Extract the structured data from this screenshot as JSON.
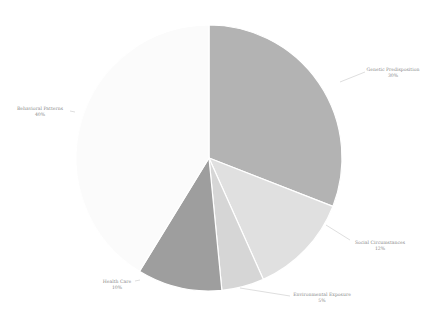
{
  "chart_data": {
    "type": "pie",
    "title": "",
    "start": "top",
    "direction": "clockwise",
    "slices": [
      {
        "label": "Genetic Predisposition",
        "value": 30,
        "display": "30%",
        "color": "#b3b3b3"
      },
      {
        "label": "Social Circumstances",
        "value": 12,
        "display": "12%",
        "color": "#e0e0e0"
      },
      {
        "label": "Environmental Exposure",
        "value": 5,
        "display": "5%",
        "color": "#d6d6d6"
      },
      {
        "label": "Health Care",
        "value": 10,
        "display": "10%",
        "color": "#9e9e9e"
      },
      {
        "label": "Behavioral Patterns",
        "value": 40,
        "display": "40%",
        "color": "#fbfbfb"
      }
    ],
    "legend": "none"
  }
}
